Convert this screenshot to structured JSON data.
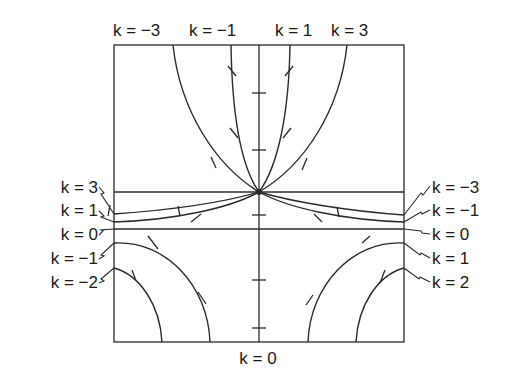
{
  "figure": {
    "type": "isocline / solution-curve diagram",
    "colors": {
      "ink": "#2a2a2a",
      "background": "#ffffff"
    },
    "top_labels": [
      {
        "text": "k = −3",
        "x": 113
      },
      {
        "text": "k = −1",
        "x": 189
      },
      {
        "text": "k = 1",
        "x": 275
      },
      {
        "text": "k = 3",
        "x": 331
      }
    ],
    "left_labels": [
      {
        "text": "k = 3",
        "y": 188
      },
      {
        "text": "k = 1",
        "y": 211
      },
      {
        "text": "k = 0",
        "y": 235
      },
      {
        "text": "k = −1",
        "y": 259
      },
      {
        "text": "k = −2",
        "y": 283
      }
    ],
    "right_labels": [
      {
        "text": "k = −3",
        "y": 188
      },
      {
        "text": "k = −1",
        "y": 211
      },
      {
        "text": "k = 0",
        "y": 235
      },
      {
        "text": "k = 1",
        "y": 259
      },
      {
        "text": "k = 2",
        "y": 283
      }
    ],
    "bottom_label": "k = 0"
  }
}
